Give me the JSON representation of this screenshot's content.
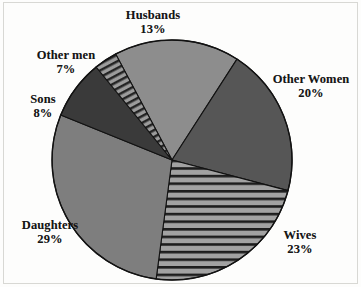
{
  "chart_data": {
    "type": "pie",
    "title": "",
    "subtitle": "",
    "xlabel": "",
    "ylabel": "",
    "legend_position": "none",
    "grid": false,
    "units": "percent",
    "total": 100,
    "labels": [
      "Husbands",
      "Other Women",
      "Wives",
      "Daughters",
      "Sons",
      "Other men"
    ],
    "values": [
      13,
      20,
      23,
      29,
      8,
      7
    ],
    "slices": [
      {
        "name": "Husbands",
        "label": "Husbands",
        "value": 13,
        "percent_text": "13%",
        "fill": "#8d8d8d",
        "pattern": "solid",
        "start_angle": 346,
        "end_angle": 46.8,
        "label_position": "top"
      },
      {
        "name": "Other Women",
        "label": "Other Women",
        "value": 20,
        "percent_text": "20%",
        "fill": "#565656",
        "pattern": "solid",
        "start_angle": 46.8,
        "end_angle": 118.8,
        "label_position": "right"
      },
      {
        "name": "Wives",
        "label": "Wives",
        "value": 23,
        "percent_text": "23%",
        "fill": "#9a9a9a",
        "pattern": "horizontal-stripes",
        "start_angle": 118.8,
        "end_angle": 201.6,
        "label_position": "bottom-right"
      },
      {
        "name": "Daughters",
        "label": "Daughters",
        "value": 29,
        "percent_text": "29%",
        "fill": "#7e7e7e",
        "pattern": "solid",
        "start_angle": 201.6,
        "end_angle": 306,
        "label_position": "bottom-left"
      },
      {
        "name": "Sons",
        "label": "Sons",
        "value": 8,
        "percent_text": "8%",
        "fill": "#3a3a3a",
        "pattern": "solid",
        "start_angle": 306,
        "end_angle": 334.8,
        "label_position": "left"
      },
      {
        "name": "Other men",
        "label": "Other men",
        "value": 7,
        "percent_text": "7%",
        "fill": "#8a8a8a",
        "pattern": "diagonal-hatch",
        "start_angle": 334.8,
        "end_angle": 346,
        "label_position": "upper-left"
      }
    ],
    "geometry": {
      "center_x": 172,
      "center_y": 160,
      "radius": 120,
      "rotation_offset_deg": -104
    },
    "colors": {
      "outline": "#121212",
      "background": "#fdfdfc",
      "text": "#161616"
    }
  },
  "labels": {
    "husbands": {
      "name": "Husbands",
      "pct": "13%"
    },
    "other_women": {
      "name": "Other Women",
      "pct": "20%"
    },
    "wives": {
      "name": "Wives",
      "pct": "23%"
    },
    "daughters": {
      "name": "Daughters",
      "pct": "29%"
    },
    "sons": {
      "name": "Sons",
      "pct": "8%"
    },
    "other_men": {
      "name": "Other men",
      "pct": "7%"
    }
  }
}
